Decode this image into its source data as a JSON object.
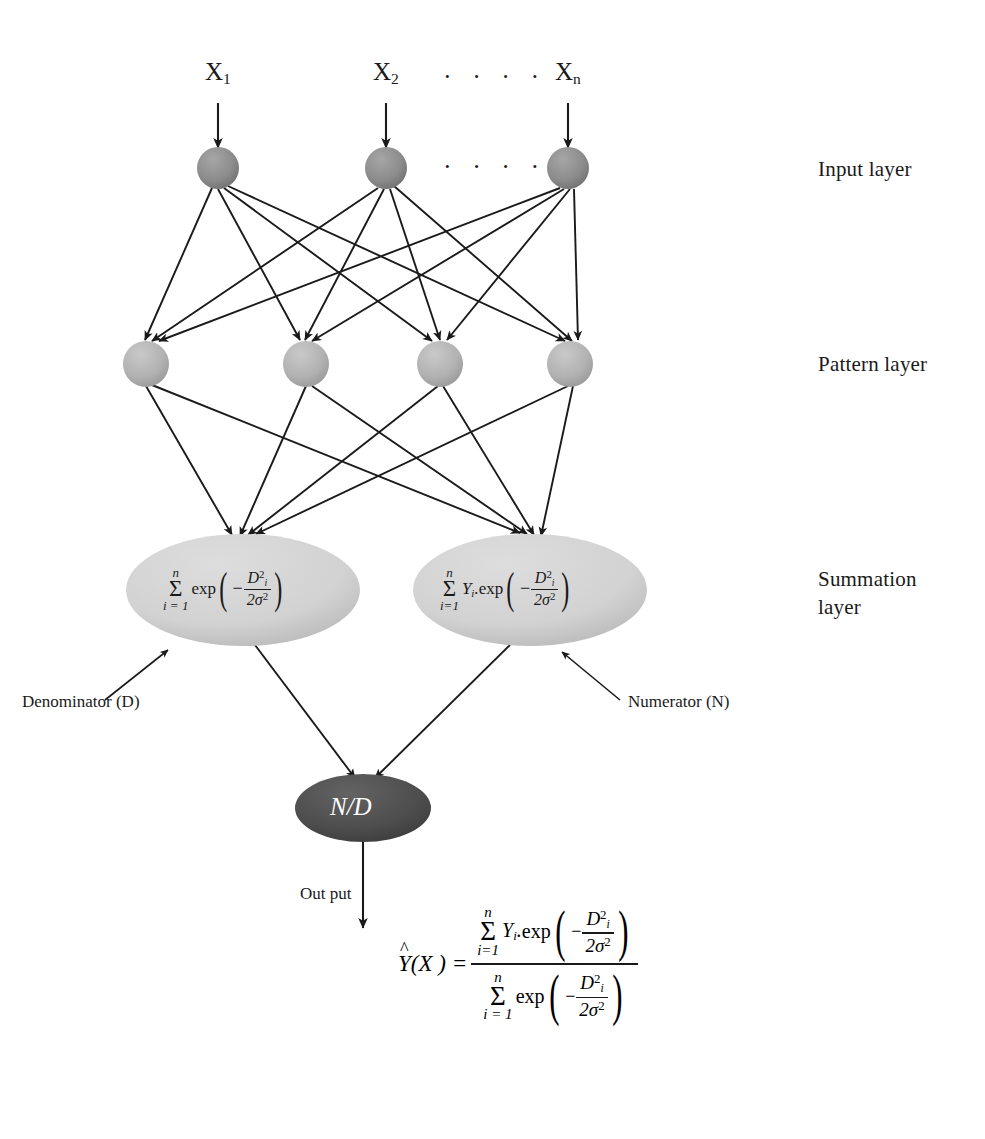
{
  "figure": {
    "background_color": "#ffffff",
    "line_color": "#1a1a1a",
    "text_color": "#1a1a1a"
  },
  "inputs": {
    "labels": [
      "X",
      "X",
      "X"
    ],
    "subscripts": [
      "1",
      "2",
      "n"
    ],
    "ellipsis_top": "· · · ·",
    "ellipsis_mid": "· · · ·"
  },
  "layer_labels": {
    "input": "Input layer",
    "pattern": "Pattern layer",
    "summation_line1": "Summation",
    "summation_line2": "layer"
  },
  "annotations": {
    "denominator": "Denominator (D)",
    "numerator": "Numerator (N)",
    "output": "Out put"
  },
  "nodes": {
    "input_color": "#8c8c8c",
    "pattern_color": "#b2b2b2",
    "summation_color": "#d2d2d2",
    "division_color": "#4d4d4d",
    "division_label": "N/D",
    "input_count": 3,
    "pattern_count": 4,
    "summation_count": 2
  },
  "summation": {
    "denominator_expr": {
      "sigma_upper": "n",
      "sigma_lower": "i = 1",
      "function": "exp",
      "sign": "−",
      "numerator": "D",
      "numerator_sup": "2",
      "numerator_sub": "i",
      "denominator": "2σ",
      "denominator_sup": "2"
    },
    "numerator_expr": {
      "sigma_upper": "n",
      "sigma_lower": "i=1",
      "coefficient": "Y",
      "coefficient_sub": "i",
      "separator": ".",
      "function": "exp",
      "sign": "−",
      "numerator": "D",
      "numerator_sup": "2",
      "numerator_sub": "i",
      "denominator": "2σ",
      "denominator_sup": "2"
    }
  },
  "output_formula": {
    "lhs_hat": "^",
    "lhs_symbol": "Y",
    "lhs_arg": "(X )",
    "equals": "=",
    "numerator": {
      "sigma_upper": "n",
      "sigma_lower": "i=1",
      "coefficient": "Y",
      "coefficient_sub": "i",
      "separator": ".",
      "function": "exp",
      "sign": "−",
      "frac_num": "D",
      "frac_num_sup": "2",
      "frac_num_sub": "i",
      "frac_den": "2σ",
      "frac_den_sup": "2"
    },
    "denominator": {
      "sigma_upper": "n",
      "sigma_lower": "i = 1",
      "function": "exp",
      "sign": "−",
      "frac_num": "D",
      "frac_num_sup": "2",
      "frac_num_sub": "i",
      "frac_den": "2σ",
      "frac_den_sup": "2"
    }
  }
}
